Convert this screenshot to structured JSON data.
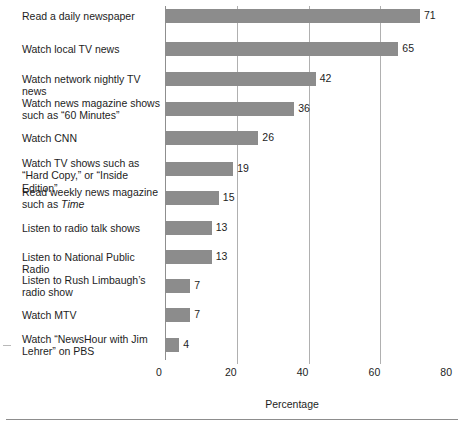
{
  "chart_data": {
    "type": "bar",
    "orientation": "horizontal",
    "title": "",
    "subtitle": "",
    "xlabel": "Percentage",
    "ylabel": "",
    "xlim": [
      0,
      80
    ],
    "xticks": [
      0,
      20,
      40,
      60,
      80
    ],
    "xticklabels": [
      "0",
      "20",
      "40",
      "60",
      "80"
    ],
    "grid": "vertical",
    "legend": "none",
    "bar_color": "#8c8c8c",
    "categories": [
      "Read a daily newspaper",
      "Watch local TV news",
      "Watch network nightly TV news",
      "Watch news magazine shows such as “60 Minutes”",
      "Watch CNN",
      "Watch TV shows such as “Hard Copy,” or “Inside Edition”",
      "Read weekly news magazine such as Time",
      "Listen to radio talk shows",
      "Listen to National Public Radio",
      "Listen to Rush Limbaugh’s radio show",
      "Watch MTV",
      "Watch “NewsHour with Jim Lehrer” on PBS"
    ],
    "values": [
      71,
      65,
      42,
      36,
      26,
      19,
      15,
      13,
      13,
      7,
      7,
      4
    ],
    "data_labels": [
      "71",
      "65",
      "42",
      "36",
      "26",
      "19",
      "15",
      "13",
      "13",
      "7",
      "7",
      "4"
    ]
  },
  "rows": [
    {
      "line1": "Read a daily newspaper",
      "line2": "",
      "italic2": "",
      "value": 71,
      "label": "71"
    },
    {
      "line1": "Watch local TV news",
      "line2": "",
      "italic2": "",
      "value": 65,
      "label": "65"
    },
    {
      "line1": "Watch network nightly TV news",
      "line2": "",
      "italic2": "",
      "value": 42,
      "label": "42"
    },
    {
      "line1": "Watch news magazine shows",
      "line2": "such as “60 Minutes”",
      "italic2": "",
      "value": 36,
      "label": "36"
    },
    {
      "line1": "Watch CNN",
      "line2": "",
      "italic2": "",
      "value": 26,
      "label": "26"
    },
    {
      "line1": "Watch TV shows such as",
      "line2": "“Hard Copy,” or “Inside Edition”",
      "italic2": "",
      "value": 19,
      "label": "19"
    },
    {
      "line1": "Read weekly news magazine",
      "line2": "such as ",
      "italic2": "Time",
      "value": 15,
      "label": "15"
    },
    {
      "line1": "Listen to radio talk shows",
      "line2": "",
      "italic2": "",
      "value": 13,
      "label": "13"
    },
    {
      "line1": "Listen to National Public Radio",
      "line2": "",
      "italic2": "",
      "value": 13,
      "label": "13"
    },
    {
      "line1": "Listen to Rush Limbaugh’s",
      "line2": "radio show",
      "italic2": "",
      "value": 7,
      "label": "7"
    },
    {
      "line1": "Watch MTV",
      "line2": "",
      "italic2": "",
      "value": 7,
      "label": "7"
    },
    {
      "line1": "Watch “NewsHour with Jim",
      "line2": "Lehrer” on PBS",
      "italic2": "",
      "value": 4,
      "label": "4"
    }
  ],
  "axis": {
    "title": "Percentage",
    "ticks": [
      "0",
      "20",
      "40",
      "60",
      "80"
    ]
  }
}
